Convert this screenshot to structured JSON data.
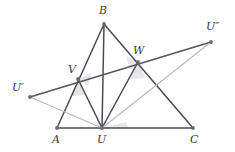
{
  "figure": {
    "width": 235,
    "height": 152,
    "background": "#ffffff",
    "colors": {
      "dark_stroke": "#4a4a55",
      "mid_stroke": "#57575f",
      "light_stroke": "#b9b9bd",
      "vertex_dot": "#6a6a72",
      "label_text": "#3a3a40",
      "angle_fill": "#e2e2e6"
    },
    "points": [
      {
        "name": "A",
        "label": "A",
        "x": 57,
        "y": 128,
        "label_x": 52,
        "label_y": 134,
        "dot": true
      },
      {
        "name": "B",
        "label": "B",
        "x": 104,
        "y": 24,
        "label_x": 99,
        "label_y": 5,
        "dot": true
      },
      {
        "name": "C",
        "label": "C",
        "x": 193,
        "y": 128,
        "label_x": 190,
        "label_y": 134,
        "dot": true
      },
      {
        "name": "U",
        "label": "U",
        "x": 102,
        "y": 128,
        "label_x": 97,
        "label_y": 134,
        "dot": true
      },
      {
        "name": "V",
        "label": "V",
        "x": 78,
        "y": 79,
        "label_x": 68,
        "label_y": 64,
        "dot": true
      },
      {
        "name": "W",
        "label": "W",
        "x": 138,
        "y": 62,
        "label_x": 133,
        "label_y": 45,
        "dot": true
      },
      {
        "name": "Uprime",
        "label": "U′",
        "x": 30,
        "y": 97,
        "label_x": 12,
        "label_y": 82,
        "dot": true
      },
      {
        "name": "Udprime",
        "label": "U″",
        "x": 211,
        "y": 42,
        "label_x": 206,
        "label_y": 21,
        "dot": true
      }
    ],
    "segments": [
      {
        "name": "side-AB",
        "from": "A",
        "to": "B",
        "shade": "dark",
        "width": 1.5
      },
      {
        "name": "side-BC",
        "from": "B",
        "to": "C",
        "shade": "dark",
        "width": 1.5
      },
      {
        "name": "side-AC",
        "from": "A",
        "to": "C",
        "shade": "dark",
        "width": 1.5
      },
      {
        "name": "cevian-BU",
        "from": "B",
        "to": "U",
        "shade": "dark",
        "width": 1.5
      },
      {
        "name": "cevian-UV",
        "from": "U",
        "to": "V",
        "shade": "dark",
        "width": 1.5
      },
      {
        "name": "cevian-UW",
        "from": "U",
        "to": "W",
        "shade": "dark",
        "width": 1.5
      },
      {
        "name": "transversal-UpUdp",
        "from": "Uprime",
        "to": "Udprime",
        "shade": "mid",
        "width": 1.6
      },
      {
        "name": "ray-Up-U",
        "from": "Uprime",
        "to": "U",
        "shade": "light",
        "width": 1.1
      },
      {
        "name": "ray-U-Udp",
        "from": "U",
        "to": "Udprime",
        "shade": "light",
        "width": 1.1
      },
      {
        "name": "ray-Up-W-ext",
        "from": "Uprime",
        "to": "Udprime",
        "shade": "none",
        "width": 0
      }
    ],
    "angle_marks": [
      {
        "name": "angle-mark-at-V-upper",
        "points": "78,79 92,72 88,86"
      },
      {
        "name": "angle-mark-at-V-lower",
        "points": "78,79 70,96 86,95"
      },
      {
        "name": "angle-mark-at-W-upper",
        "points": "138,62 126,56 130,70"
      },
      {
        "name": "angle-mark-at-W-lower",
        "points": "138,62 130,79 146,78"
      },
      {
        "name": "angle-mark-at-U-right",
        "points": "102,128 126,122 128,128"
      }
    ]
  }
}
